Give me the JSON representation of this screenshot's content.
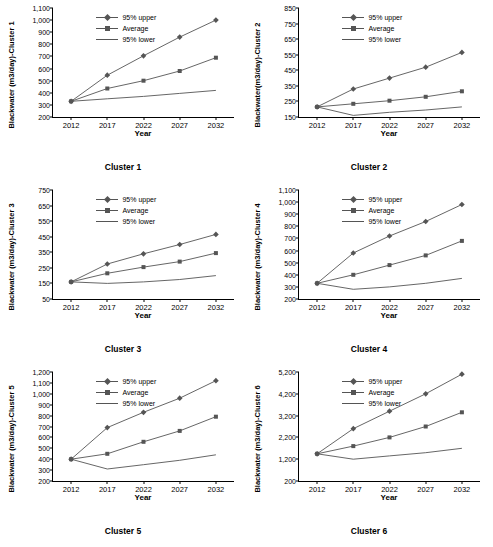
{
  "legend": {
    "items": [
      {
        "label": "95% upper",
        "marker": "diamond",
        "color": "#555555"
      },
      {
        "label": "Average",
        "marker": "square",
        "color": "#555555"
      },
      {
        "label": "95% lower",
        "marker": "none",
        "color": "#555555"
      }
    ]
  },
  "chart_data": [
    {
      "type": "line",
      "title": "Cluster 1",
      "xlabel": "Year",
      "ylabel": "Blackwater (m3/day)-Cluster 1",
      "x": [
        "2012",
        "2017",
        "2022",
        "2027",
        "2032"
      ],
      "yticks": [
        200,
        300,
        400,
        500,
        600,
        700,
        800,
        900,
        1000,
        1100
      ],
      "ylim": [
        200,
        1100
      ],
      "series": [
        {
          "name": "95% upper",
          "values": [
            330,
            545,
            705,
            860,
            1000
          ]
        },
        {
          "name": "Average",
          "values": [
            330,
            435,
            500,
            580,
            690
          ]
        },
        {
          "name": "95% lower",
          "values": [
            330,
            350,
            370,
            395,
            420
          ]
        }
      ]
    },
    {
      "type": "line",
      "title": "Cluster 2",
      "xlabel": "Year",
      "ylabel": "Blackwater(m3/day)-Cluster 2",
      "x": [
        "2012",
        "2017",
        "2022",
        "2027",
        "2032"
      ],
      "yticks": [
        150,
        250,
        350,
        450,
        550,
        650,
        750,
        850
      ],
      "ylim": [
        150,
        850
      ],
      "series": [
        {
          "name": "95% upper",
          "values": [
            215,
            330,
            400,
            470,
            565
          ]
        },
        {
          "name": "Average",
          "values": [
            215,
            235,
            255,
            280,
            315
          ]
        },
        {
          "name": "95% lower",
          "values": [
            215,
            160,
            180,
            195,
            215
          ]
        }
      ]
    },
    {
      "type": "line",
      "title": "Cluster 3",
      "xlabel": "Year",
      "ylabel": "Blackwater (m3/day)-Cluster 3",
      "x": [
        "2012",
        "2017",
        "2022",
        "2027",
        "2032"
      ],
      "yticks": [
        50,
        150,
        250,
        350,
        450,
        550,
        650,
        750
      ],
      "ylim": [
        50,
        750
      ],
      "series": [
        {
          "name": "95% upper",
          "values": [
            160,
            275,
            340,
            400,
            465
          ]
        },
        {
          "name": "Average",
          "values": [
            160,
            215,
            255,
            290,
            345
          ]
        },
        {
          "name": "95% lower",
          "values": [
            160,
            150,
            160,
            175,
            200
          ]
        }
      ]
    },
    {
      "type": "line",
      "title": "Cluster 4",
      "xlabel": "Year",
      "ylabel": "Blackwater (m3/day)-Cluster 4",
      "x": [
        "2012",
        "2017",
        "2022",
        "2027",
        "2032"
      ],
      "yticks": [
        200,
        300,
        400,
        500,
        600,
        700,
        800,
        900,
        1000,
        1100
      ],
      "ylim": [
        200,
        1100
      ],
      "series": [
        {
          "name": "95% upper",
          "values": [
            330,
            580,
            720,
            840,
            980
          ]
        },
        {
          "name": "Average",
          "values": [
            330,
            400,
            480,
            560,
            680
          ]
        },
        {
          "name": "95% lower",
          "values": [
            330,
            280,
            300,
            330,
            370
          ]
        }
      ]
    },
    {
      "type": "line",
      "title": "Cluster 5",
      "xlabel": "Year",
      "ylabel": "Blackwater (m3/day)-Cluster 5",
      "x": [
        "2012",
        "2017",
        "2022",
        "2027",
        "2032"
      ],
      "yticks": [
        200,
        300,
        400,
        500,
        600,
        700,
        800,
        900,
        1000,
        1100,
        1200
      ],
      "ylim": [
        200,
        1200
      ],
      "series": [
        {
          "name": "95% upper",
          "values": [
            400,
            690,
            830,
            960,
            1120
          ]
        },
        {
          "name": "Average",
          "values": [
            400,
            450,
            560,
            660,
            790
          ]
        },
        {
          "name": "95% lower",
          "values": [
            400,
            310,
            350,
            390,
            440
          ]
        }
      ]
    },
    {
      "type": "line",
      "title": "Cluster 6",
      "xlabel": "Year",
      "ylabel": "Blackwater (m3/day)-Cluster 6",
      "x": [
        "2012",
        "2017",
        "2022",
        "2027",
        "2032"
      ],
      "yticks": [
        200,
        1200,
        2200,
        3200,
        4200,
        5200
      ],
      "ylim": [
        200,
        5200
      ],
      "series": [
        {
          "name": "95% upper",
          "values": [
            1450,
            2600,
            3400,
            4200,
            5100
          ]
        },
        {
          "name": "Average",
          "values": [
            1450,
            1800,
            2200,
            2700,
            3350
          ]
        },
        {
          "name": "95% lower",
          "values": [
            1450,
            1200,
            1350,
            1500,
            1700
          ]
        }
      ]
    }
  ]
}
